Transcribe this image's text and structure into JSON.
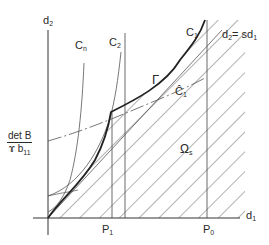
{
  "axes": {
    "x_label": "d",
    "x_sub": "1",
    "y_label": "d",
    "y_sub": "2"
  },
  "curves": {
    "cn": {
      "label": "C",
      "sub": "n"
    },
    "c2": {
      "label": "C",
      "sub": "2"
    },
    "c1": {
      "label": "C",
      "sub": "1"
    },
    "c1_hat": {
      "label": "Ĉ",
      "sub": "1"
    },
    "gamma": {
      "label": "Γ"
    },
    "line": {
      "label": "d",
      "sub": "2",
      "rest": "= sd",
      "rest_sub": "1"
    }
  },
  "region": {
    "label": "Ω",
    "sub": "s"
  },
  "points": {
    "p1": {
      "label": "P",
      "sub": "1"
    },
    "p0": {
      "label": "P",
      "sub": "0"
    }
  },
  "y_intercept": {
    "numerator": "det B",
    "denominator": "ɤ b",
    "denominator_sub": "11"
  },
  "colors": {
    "ink": "#2a2a2a",
    "hatch": "#555555",
    "background": "#ffffff"
  }
}
